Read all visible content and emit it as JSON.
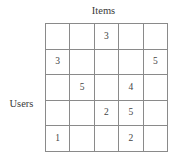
{
  "figure": {
    "column_axis_label": "Items",
    "row_axis_label": "Users"
  },
  "chart_data": {
    "type": "table",
    "title": "",
    "xlabel": "Items",
    "ylabel": "Users",
    "n_rows": 5,
    "n_cols": 5,
    "grid": true,
    "legend": "none",
    "value_range": [
      1,
      5
    ],
    "rows": [
      [
        "",
        "",
        "3",
        "",
        ""
      ],
      [
        "3",
        "",
        "",
        "",
        "5"
      ],
      [
        "",
        "5",
        "",
        "4",
        ""
      ],
      [
        "",
        "",
        "2",
        "5",
        ""
      ],
      [
        "1",
        "",
        "",
        "2",
        ""
      ]
    ]
  }
}
